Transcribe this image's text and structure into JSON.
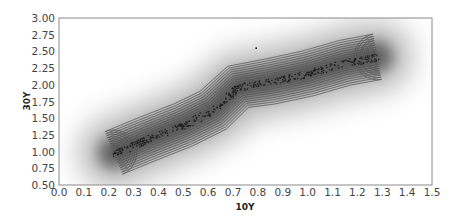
{
  "chart_data": {
    "type": "scatter",
    "subtype": "kde-density-with-contours",
    "title": "",
    "xlabel": "10Y",
    "ylabel": "30Y",
    "xlim": [
      0.0,
      1.5
    ],
    "ylim": [
      0.5,
      3.0
    ],
    "grid": false,
    "legend": null,
    "x_ticks": [
      "0.0",
      "0.1",
      "0.2",
      "0.3",
      "0.4",
      "0.5",
      "0.6",
      "0.7",
      "0.8",
      "0.9",
      "1.0",
      "1.1",
      "1.2",
      "1.3",
      "1.4",
      "1.5"
    ],
    "y_ticks": [
      "0.50",
      "0.75",
      "1.00",
      "1.25",
      "1.50",
      "1.75",
      "2.00",
      "2.25",
      "2.50",
      "2.75",
      "3.00"
    ],
    "colors": {
      "density": "#000000",
      "contour": "#555555",
      "points": "#1a1a1a",
      "axis": "#888888"
    },
    "density_ridge": {
      "description": "Diagonal high-density band of 10Y vs 30Y yields",
      "ridge_points": [
        [
          0.22,
          0.98
        ],
        [
          0.35,
          1.18
        ],
        [
          0.5,
          1.4
        ],
        [
          0.62,
          1.62
        ],
        [
          0.72,
          1.97
        ],
        [
          0.85,
          2.05
        ],
        [
          1.0,
          2.17
        ],
        [
          1.15,
          2.33
        ],
        [
          1.28,
          2.42
        ]
      ],
      "contour_levels": 10
    },
    "points_summary": {
      "x_range": [
        0.22,
        1.28
      ],
      "y_range": [
        0.95,
        2.45
      ],
      "outliers": [
        [
          0.79,
          2.56
        ]
      ]
    }
  },
  "labels": {
    "xlabel": "10Y",
    "ylabel": "30Y"
  }
}
